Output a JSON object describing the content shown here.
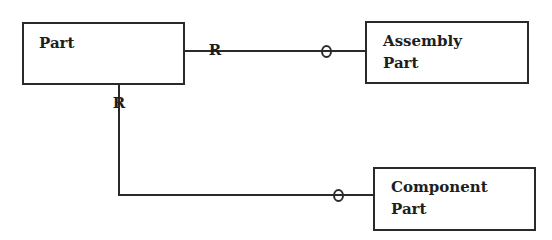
{
  "diagram": {
    "type": "entity-relationship",
    "entities": [
      {
        "id": "part",
        "label": "Part"
      },
      {
        "id": "assembly_part",
        "label_line1": "Assembly",
        "label_line2": "Part"
      },
      {
        "id": "component_part",
        "label_line1": "Component",
        "label_line2": "Part"
      }
    ],
    "relationships": [
      {
        "from": "Part",
        "to": "Assembly Part",
        "from_marker": "R",
        "to_marker": "O"
      },
      {
        "from": "Part",
        "to": "Component Part",
        "from_marker": "R",
        "to_marker": "O"
      }
    ],
    "markers": {
      "required": "R",
      "optional": "O"
    },
    "colors": {
      "line": "#2a2a2a",
      "text": "#1e1e1e",
      "background": "#ffffff"
    }
  }
}
